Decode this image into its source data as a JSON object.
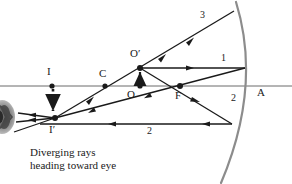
{
  "figure": {
    "kind": "ray-diagram-concave-mirror",
    "caption": "Diverging rays\nheading toward eye",
    "background": "#ffffff",
    "ink": "#1a1a1a",
    "mirror_color": "#8c8c8c"
  },
  "points": [
    {
      "id": "I",
      "label": "I",
      "x": 52,
      "y": 86,
      "label_x": 47,
      "label_y": 68,
      "dot": true
    },
    {
      "id": "Ip",
      "label": "I′",
      "x": 55,
      "y": 118,
      "label_x": 50,
      "label_y": 126,
      "dot": true
    },
    {
      "id": "C",
      "label": "C",
      "x": 105,
      "y": 86,
      "label_x": 100,
      "label_y": 70,
      "dot": true
    },
    {
      "id": "O",
      "label": "O",
      "x": 140,
      "y": 86,
      "label_x": 128,
      "label_y": 92,
      "dot": true
    },
    {
      "id": "Op",
      "label": "O′",
      "x": 140,
      "y": 68,
      "label_x": 132,
      "label_y": 50,
      "dot": true
    },
    {
      "id": "F",
      "label": "F",
      "x": 180,
      "y": 86,
      "label_x": 176,
      "label_y": 94,
      "dot": true
    },
    {
      "id": "A",
      "label": "A",
      "x": 247,
      "y": 86,
      "label_x": 258,
      "label_y": 90,
      "dot": false
    }
  ],
  "ray_labels": [
    {
      "id": "ray-3",
      "text": "3",
      "x": 201,
      "y": 12
    },
    {
      "id": "ray-1",
      "text": "1",
      "x": 222,
      "y": 56
    },
    {
      "id": "ray-2-upper",
      "text": "2",
      "x": 232,
      "y": 96
    },
    {
      "id": "ray-2-lower",
      "text": "2",
      "x": 148,
      "y": 128
    }
  ],
  "axis": {
    "y": 86,
    "x1": 0,
    "x2": 292
  },
  "mirror": {
    "vertex_x": 247,
    "vertex_y": 86,
    "top_x": 236,
    "top_y": 2,
    "bottom_x": 221,
    "bottom_y": 183
  },
  "object_arrow": {
    "x": 140,
    "from_y": 86,
    "to_y": 69
  },
  "image_arrow": {
    "x": 53,
    "from_y": 88,
    "to_y": 116,
    "dashed": true
  }
}
